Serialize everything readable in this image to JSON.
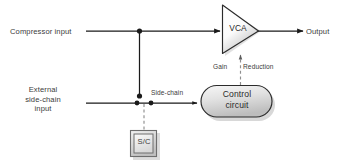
{
  "diagram": {
    "labels": {
      "compressor_input": "Compressor input",
      "external_sidechain_input": "External\nside-chain\ninput",
      "external_line1": "External",
      "external_line2": "side-chain",
      "external_line3": "input",
      "sidechain": "Side-chain",
      "gain": "Gain",
      "reduction": "Reduction",
      "output": "Output",
      "sc_box": "S/C"
    },
    "blocks": {
      "vca": {
        "label": "VCA",
        "shape": "triangle"
      },
      "control_circuit": {
        "label_line1": "Control",
        "label_line2": "circuit",
        "shape": "rounded-rectangle"
      },
      "sc_switch": {
        "label": "S/C",
        "shape": "double-square"
      }
    },
    "colors": {
      "line": "#1a1a1a",
      "text": "#3b3b3b",
      "block_stroke": "#2b2b2b",
      "block_fill_light": "#ffffff",
      "block_fill_dark": "#c9c9c9",
      "dashed_line": "#8a8a8a",
      "shadow": "#b5b5b5",
      "background": "#ffffff"
    }
  }
}
